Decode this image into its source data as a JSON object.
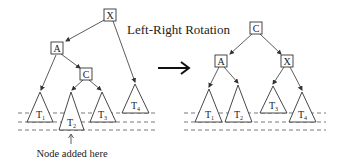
{
  "title": "Left-Right Rotation",
  "caption": "Node added here",
  "colors": {
    "stroke": "#333333",
    "text": "#222222",
    "background": "#ffffff"
  },
  "before_tree": {
    "nodes": [
      {
        "id": "X",
        "label": "X",
        "role": "root"
      },
      {
        "id": "A",
        "label": "A",
        "role": "left child of X"
      },
      {
        "id": "C",
        "label": "C",
        "role": "right child of A"
      }
    ],
    "subtrees": [
      {
        "label": "T",
        "sub": "1",
        "parent": "A"
      },
      {
        "label": "T",
        "sub": "2",
        "parent": "C",
        "note": "grew by one level"
      },
      {
        "label": "T",
        "sub": "3",
        "parent": "C"
      },
      {
        "label": "T",
        "sub": "4",
        "parent": "X"
      }
    ]
  },
  "after_tree": {
    "nodes": [
      {
        "id": "C",
        "label": "C",
        "role": "root"
      },
      {
        "id": "A",
        "label": "A",
        "role": "left child of C"
      },
      {
        "id": "X",
        "label": "X",
        "role": "right child of C"
      }
    ],
    "subtrees": [
      {
        "label": "T",
        "sub": "1",
        "parent": "A"
      },
      {
        "label": "T",
        "sub": "2",
        "parent": "A"
      },
      {
        "label": "T",
        "sub": "3",
        "parent": "X"
      },
      {
        "label": "T",
        "sub": "4",
        "parent": "X"
      }
    ]
  },
  "transition_arrow": "right-arrow"
}
